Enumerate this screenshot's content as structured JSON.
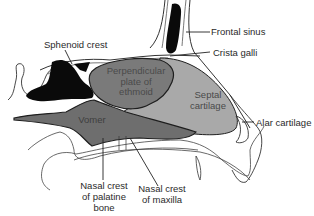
{
  "diagram": {
    "labels": {
      "frontal_sinus": "Frontal sinus",
      "crista_galli": "Crista galli",
      "sphenoid_crest": "Sphenoid crest",
      "alar_cartilage": "Alar cartilage",
      "nasal_crest_palatine_line1": "Nasal crest",
      "nasal_crest_palatine_line2": "of palatine",
      "nasal_crest_palatine_line3": "bone",
      "nasal_crest_maxilla_line1": "Nasal crest",
      "nasal_crest_maxilla_line2": "of maxilla"
    },
    "regions": {
      "perpendicular_plate_line1": "Perpendicular",
      "perpendicular_plate_line2": "plate of",
      "perpendicular_plate_line3": "ethmoid",
      "septal_cartilage_line1": "Septal",
      "septal_cartilage_line2": "cartilage",
      "vomer": "Vomer"
    },
    "colors": {
      "perpendicular_plate": "#7a7a7a",
      "septal_cartilage": "#a9a9a9",
      "vomer": "#6e6e6e",
      "sinus_black": "#0a0a0a",
      "outline": "#1e1e1e",
      "label_text": "#2a2a2a"
    }
  }
}
